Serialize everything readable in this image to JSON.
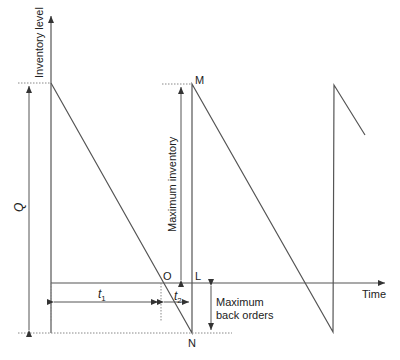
{
  "diagram": {
    "type": "inventory-model-with-backorders",
    "labels": {
      "y_axis": "Inventory level",
      "x_axis": "Time",
      "q": "Q",
      "max_inventory": "Maximum inventory",
      "max_backorders_line1": "Maximum",
      "max_backorders_line2": "back orders",
      "point_m": "M",
      "point_n": "N",
      "point_o": "O",
      "point_l": "L",
      "t1": "t",
      "t1_sub": "1",
      "t2": "t",
      "t2_sub": "2"
    },
    "caption_partial": "",
    "colors": {
      "line": "#555555",
      "dotted": "#777777",
      "text": "#222222"
    }
  }
}
